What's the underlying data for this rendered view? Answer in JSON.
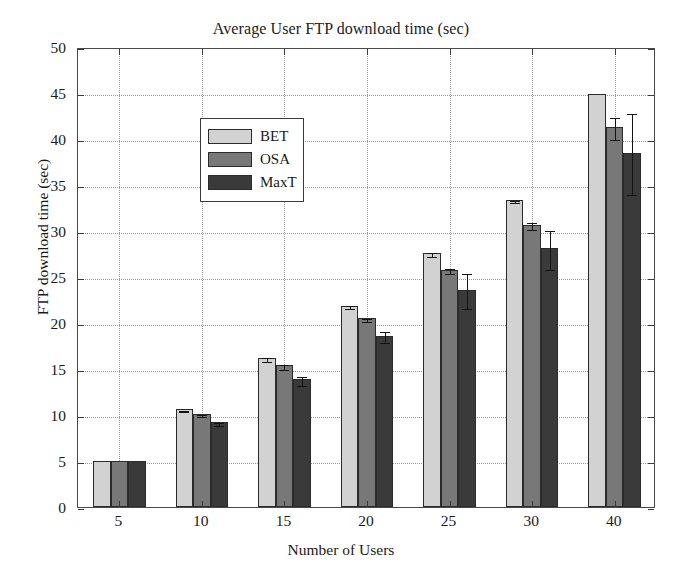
{
  "chart_data": {
    "type": "bar",
    "title": "Average User FTP download time (sec)",
    "xlabel": "Number of Users",
    "ylabel": "FTP download time (sec)",
    "categories": [
      "5",
      "10",
      "15",
      "20",
      "25",
      "30",
      "40"
    ],
    "ylim": [
      0,
      50
    ],
    "ytick_labels": [
      "0",
      "5",
      "10",
      "15",
      "20",
      "25",
      "30",
      "35",
      "40",
      "45",
      "50"
    ],
    "ytick_values": [
      0,
      5,
      10,
      15,
      20,
      25,
      30,
      35,
      40,
      45,
      50
    ],
    "grid": true,
    "legend_position": "upper left",
    "series": [
      {
        "name": "BET",
        "color": "#d2d2d2",
        "values": [
          5.0,
          10.6,
          16.2,
          21.9,
          27.6,
          33.4,
          44.9
        ],
        "errors": [
          0.0,
          0.1,
          0.2,
          0.2,
          0.2,
          0.1,
          0.0
        ]
      },
      {
        "name": "OSA",
        "color": "#787878",
        "values": [
          5.0,
          10.1,
          15.4,
          20.5,
          25.8,
          30.7,
          41.3
        ],
        "errors": [
          0.0,
          0.1,
          0.3,
          0.2,
          0.3,
          0.4,
          1.2
        ]
      },
      {
        "name": "MaxT",
        "color": "#3a3a3a",
        "values": [
          5.0,
          9.2,
          13.9,
          18.6,
          23.6,
          28.1,
          38.5
        ],
        "errors": [
          0.0,
          0.2,
          0.5,
          0.6,
          1.9,
          2.1,
          4.4
        ]
      }
    ]
  },
  "legend": {
    "items": [
      {
        "label": "BET"
      },
      {
        "label": "OSA"
      },
      {
        "label": "MaxT"
      }
    ]
  }
}
